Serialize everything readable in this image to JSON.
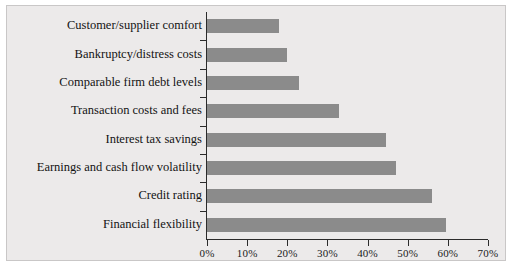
{
  "chart_data": {
    "type": "bar",
    "orientation": "horizontal",
    "title": "",
    "xlabel": "",
    "ylabel": "",
    "categories": [
      "Customer/supplier comfort",
      "Bankruptcy/distress costs",
      "Comparable firm debt levels",
      "Transaction costs and fees",
      "Interest tax savings",
      "Earnings and cash flow volatility",
      "Credit rating",
      "Financial flexibility"
    ],
    "values": [
      18,
      20,
      23,
      33,
      44.5,
      47,
      56,
      59.5
    ],
    "xlim": [
      0,
      70
    ],
    "xticks": [
      0,
      10,
      20,
      30,
      40,
      50,
      60,
      70
    ],
    "xticklabels": [
      "0%",
      "10%",
      "20%",
      "30%",
      "40%",
      "50%",
      "60%",
      "70%"
    ],
    "grid": false,
    "legend": null,
    "bar_color": "#8b8b8b",
    "panel_color": "#eceaea",
    "axis_color": "#2b2b2b"
  }
}
